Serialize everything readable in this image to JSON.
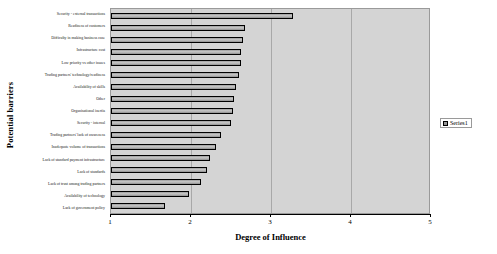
{
  "chart_data": {
    "type": "bar",
    "orientation": "horizontal",
    "title": "",
    "xlabel": "Degree of Influence",
    "ylabel": "Potential barriers",
    "xlim": [
      1,
      5
    ],
    "xticks": [
      "1",
      "2",
      "3",
      "4",
      "5"
    ],
    "grid": true,
    "legend_position": "right",
    "legend": [
      "Series1"
    ],
    "categories": [
      "Security - external transactions",
      "Readiness of customers",
      "Difficulty in making business case",
      "Infrastructure cost",
      "Low priority vs other issues",
      "Trading partners' technology/readiness",
      "Availability of skills",
      "Other",
      "Organisational inertia",
      "Security - internal",
      "Trading partners' lack of awareness",
      "Inadequate volume of transactions",
      "Lack of standard payment infrastructure",
      "Lack of standards",
      "Lack of trust among trading partners",
      "Availability of technology",
      "Lack of government policy"
    ],
    "series": [
      {
        "name": "Series1",
        "values": [
          3.28,
          2.68,
          2.65,
          2.63,
          2.62,
          2.6,
          2.56,
          2.54,
          2.52,
          2.5,
          2.38,
          2.31,
          2.24,
          2.2,
          2.12,
          1.98,
          1.68
        ]
      }
    ]
  },
  "axes": {
    "x_title": "Degree of Influence",
    "y_title": "Potential barriers"
  }
}
